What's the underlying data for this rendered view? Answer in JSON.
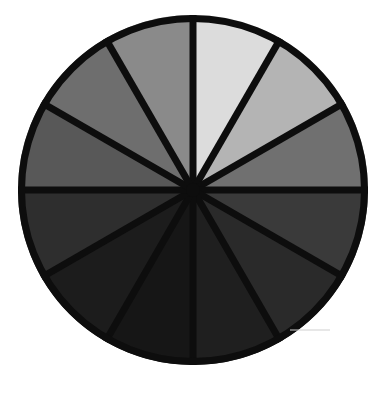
{
  "figure": {
    "name": "grayscale-value-wheel",
    "background_color": "#ffffff",
    "outline_color": "#0d0d0d",
    "outline_width": 7,
    "spoke_color": "#0d0d0d",
    "spoke_width": 7,
    "hub_radius": 7,
    "center": {
      "x": 193,
      "y": 190
    },
    "radius": 175,
    "sector_count": 12,
    "sector_angle_degrees": 30
  },
  "chart_data": {
    "type": "pie",
    "xlabel": "",
    "ylabel": "",
    "legend": "none",
    "grid": false,
    "equal_slices": true,
    "slice_value": 8.333,
    "categories": [
      "12 o'clock",
      "1 o'clock",
      "2 o'clock",
      "3 o'clock",
      "4 o'clock",
      "5 o'clock",
      "6 o'clock",
      "7 o'clock",
      "8 o'clock",
      "9 o'clock",
      "10 o'clock",
      "11 o'clock"
    ],
    "values": [
      8.333,
      8.333,
      8.333,
      8.333,
      8.333,
      8.333,
      8.333,
      8.333,
      8.333,
      8.333,
      8.333,
      8.333
    ],
    "colors": [
      "#dcdcdc",
      "#b4b4b4",
      "#707070",
      "#3a3a3a",
      "#2a2a2a",
      "#1f1f1f",
      "#161616",
      "#1c1c1c",
      "#2e2e2e",
      "#585858",
      "#6e6e6e",
      "#8a8a8a"
    ],
    "slices": [
      {
        "index": 1,
        "label": "12 o'clock",
        "start_deg": 0,
        "end_deg": 30,
        "value": 8.333,
        "color": "#dcdcdc",
        "lightness": 86
      },
      {
        "index": 2,
        "label": "1 o'clock",
        "start_deg": 30,
        "end_deg": 60,
        "value": 8.333,
        "color": "#b4b4b4",
        "lightness": 71
      },
      {
        "index": 3,
        "label": "2 o'clock",
        "start_deg": 60,
        "end_deg": 90,
        "value": 8.333,
        "color": "#707070",
        "lightness": 44
      },
      {
        "index": 4,
        "label": "3 o'clock",
        "start_deg": 90,
        "end_deg": 120,
        "value": 8.333,
        "color": "#3a3a3a",
        "lightness": 23
      },
      {
        "index": 5,
        "label": "4 o'clock",
        "start_deg": 120,
        "end_deg": 150,
        "value": 8.333,
        "color": "#2a2a2a",
        "lightness": 16
      },
      {
        "index": 6,
        "label": "5 o'clock",
        "start_deg": 150,
        "end_deg": 180,
        "value": 8.333,
        "color": "#1f1f1f",
        "lightness": 12
      },
      {
        "index": 7,
        "label": "6 o'clock",
        "start_deg": 180,
        "end_deg": 210,
        "value": 8.333,
        "color": "#161616",
        "lightness": 9
      },
      {
        "index": 8,
        "label": "7 o'clock",
        "start_deg": 210,
        "end_deg": 240,
        "value": 8.333,
        "color": "#1c1c1c",
        "lightness": 11
      },
      {
        "index": 9,
        "label": "8 o'clock",
        "start_deg": 240,
        "end_deg": 270,
        "value": 8.333,
        "color": "#2e2e2e",
        "lightness": 18
      },
      {
        "index": 10,
        "label": "9 o'clock",
        "start_deg": 270,
        "end_deg": 300,
        "value": 8.333,
        "color": "#585858",
        "lightness": 35
      },
      {
        "index": 11,
        "label": "10 o'clock",
        "start_deg": 300,
        "end_deg": 330,
        "value": 8.333,
        "color": "#6e6e6e",
        "lightness": 43
      },
      {
        "index": 12,
        "label": "11 o'clock",
        "start_deg": 330,
        "end_deg": 360,
        "value": 8.333,
        "color": "#8a8a8a",
        "lightness": 54
      }
    ],
    "annotation": {
      "tick_mark_color": "#cfcfcf",
      "tick_mark_x1": 290,
      "tick_mark_x2": 330,
      "tick_mark_y": 330
    }
  }
}
